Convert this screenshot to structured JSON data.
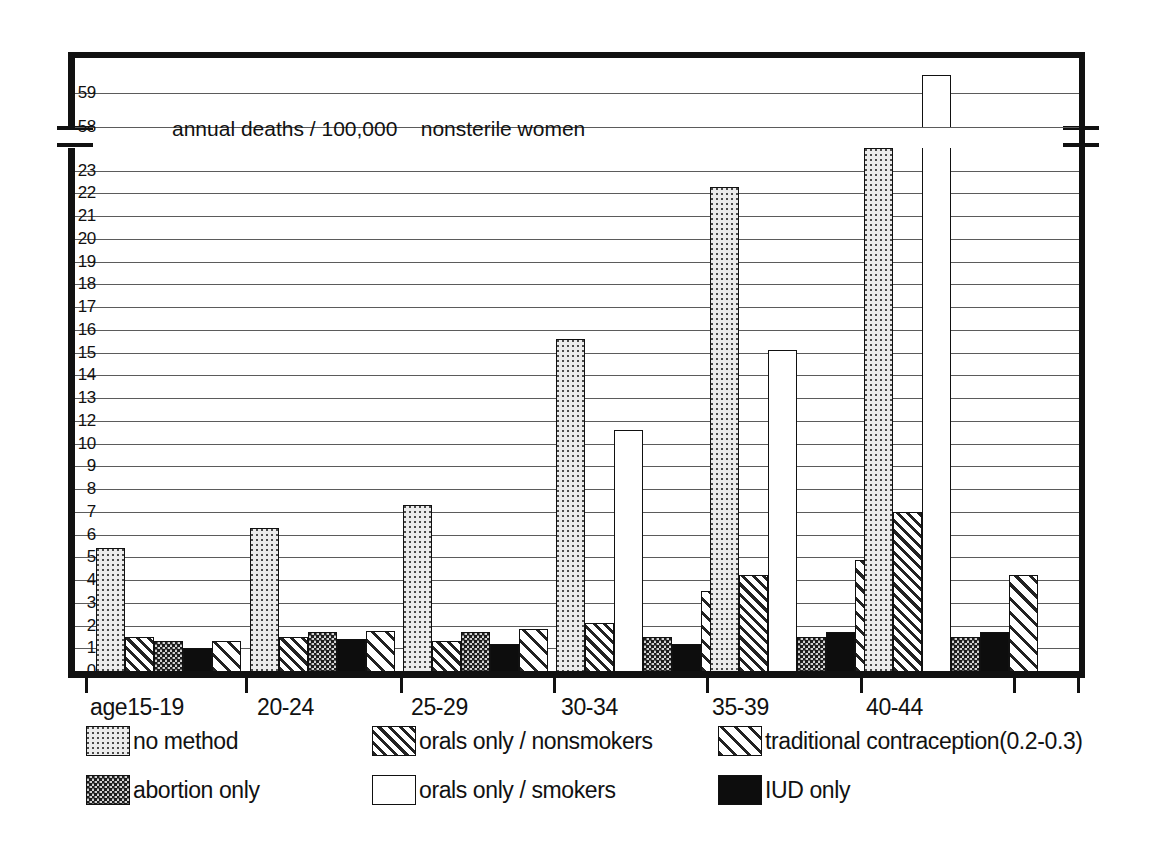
{
  "chart_data": {
    "type": "bar",
    "title": "annual deaths / 100,000    nonsterile women",
    "xlabel": "age",
    "ylabel": "",
    "categories": [
      "15-19",
      "20-24",
      "25-29",
      "30-34",
      "35-39",
      "40-44"
    ],
    "x_axis_prefix": "age",
    "ylim": [
      0,
      23
    ],
    "ylim_upper": [
      58,
      60
    ],
    "axis_break": true,
    "grid": true,
    "legend_position": "bottom",
    "y_tick_labels_lower": [
      "0",
      "1",
      "2",
      "3",
      "4",
      "5",
      "6",
      "7",
      "8",
      "9",
      "10",
      "12",
      "13",
      "14",
      "15",
      "16",
      "17",
      "18",
      "19",
      "20",
      "21",
      "22",
      "23"
    ],
    "y_tick_labels_upper": [
      "58",
      "59"
    ],
    "series": [
      {
        "name": "no method",
        "key": "no-method",
        "pattern": "fine-dots-light",
        "values": [
          5.4,
          6.3,
          7.3,
          14.6,
          21.3,
          23.0
        ]
      },
      {
        "name": "orals only / nonsmokers",
        "key": "orals-nonsmokers",
        "pattern": "dense-diagonal-hatch",
        "values": [
          1.5,
          1.5,
          1.3,
          2.1,
          4.2,
          7.0
        ]
      },
      {
        "name": "orals only / smokers",
        "key": "orals-smokers",
        "pattern": "white-open",
        "values": [
          null,
          null,
          null,
          10.6,
          14.1,
          59.5
        ]
      },
      {
        "name": "abortion only",
        "key": "abortion-only",
        "pattern": "checkered-dots",
        "values": [
          1.3,
          1.7,
          1.7,
          1.5,
          1.5,
          1.5
        ]
      },
      {
        "name": "IUD   only",
        "key": "iud-only",
        "pattern": "solid-black",
        "values": [
          1.0,
          1.4,
          1.2,
          1.2,
          1.7,
          1.7
        ]
      },
      {
        "name": "traditional contraception(0.2-0.3)",
        "key": "traditional",
        "pattern": "wide-diagonal-hatch",
        "values": [
          1.3,
          1.75,
          1.85,
          3.5,
          4.9,
          4.2
        ]
      }
    ],
    "legend_entries": [
      {
        "label": "no method",
        "pattern": "fine-dots-light"
      },
      {
        "label": "orals only / nonsmokers",
        "pattern": "dense-diagonal-hatch"
      },
      {
        "label": "traditional contraception(0.2-0.3)",
        "pattern": "wide-diagonal-hatch"
      },
      {
        "label": "abortion only",
        "pattern": "checkered-dots"
      },
      {
        "label": "orals only / smokers",
        "pattern": "white-open"
      },
      {
        "label": "IUD   only",
        "pattern": "solid-black"
      }
    ]
  }
}
